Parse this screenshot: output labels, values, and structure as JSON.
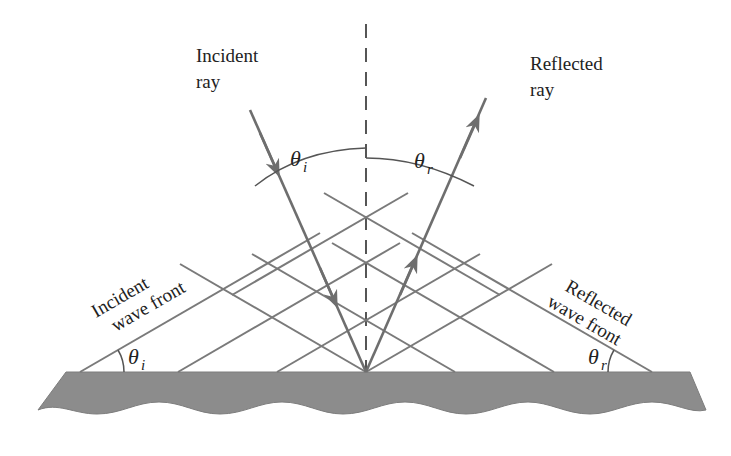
{
  "diagram": {
    "type": "reflection-of-waves",
    "colors": {
      "background": "#ffffff",
      "line": "#7a7a7a",
      "ray": "#6e6e6e",
      "surface": "#8c8c8c",
      "normal": "#444444",
      "text": "#222222"
    },
    "labels": {
      "incident_ray_line1": "Incident",
      "incident_ray_line2": "ray",
      "reflected_ray_line1": "Reflected",
      "reflected_ray_line2": "ray",
      "incident_wave_front_line1": "Incident",
      "incident_wave_front_line2": "wave front",
      "reflected_wave_front_line1": "Reflected",
      "reflected_wave_front_line2": "wave front",
      "theta": "θ",
      "sub_i": "i",
      "sub_r": "r"
    },
    "angles": {
      "incidence_symbol": "θi",
      "reflection_symbol": "θr"
    }
  }
}
